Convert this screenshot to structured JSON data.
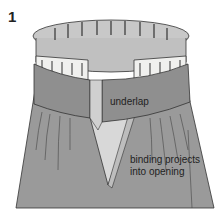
{
  "figure": {
    "number": "1",
    "labels": {
      "underlap": "underlap",
      "binding_line1": "binding projects",
      "binding_line2": "into opening"
    },
    "colors": {
      "fabric": "#9a9a9a",
      "band": "#8f8f8f",
      "inner": "#c8c8c8",
      "interfacing": "#f0f0ee",
      "outline": "#333333"
    }
  }
}
